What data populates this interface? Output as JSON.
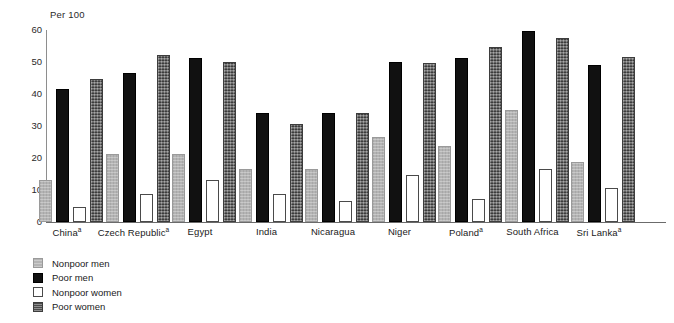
{
  "chart_data": {
    "type": "bar",
    "title": "",
    "subtitle": "",
    "xlabel": "",
    "ylabel": "Per 100",
    "ylim": [
      0,
      60
    ],
    "yticks": [
      0,
      10,
      20,
      30,
      40,
      50,
      60
    ],
    "grid": false,
    "legend_position": "bottom-left",
    "categories": [
      "China",
      "Czech Republic",
      "Egypt",
      "India",
      "Nicaragua",
      "Niger",
      "Poland",
      "South Africa",
      "Sri Lanka"
    ],
    "category_labels": [
      "Chinaᵃ",
      "Czech Republicᵃ",
      "Egypt",
      "India",
      "Nicaragua",
      "Niger",
      "Polandᵃ",
      "South Africa",
      "Sri Lankaᵃ"
    ],
    "category_footnote_marks": [
      "a",
      "a",
      "",
      "",
      "",
      "",
      "a",
      "",
      "a"
    ],
    "series": [
      {
        "name": "Nonpoor men",
        "color": "#b4b4b4",
        "values": [
          12.5,
          20.5,
          20.5,
          16.0,
          16.0,
          26.0,
          23.0,
          34.5,
          18.0
        ]
      },
      {
        "name": "Poor men",
        "color": "#111111",
        "values": [
          41.0,
          46.0,
          50.5,
          33.5,
          33.5,
          49.5,
          50.5,
          59.0,
          48.5
        ]
      },
      {
        "name": "Nonpoor women",
        "color": "#ffffff",
        "values": [
          4.0,
          8.0,
          12.5,
          8.0,
          6.0,
          14.0,
          6.5,
          16.0,
          10.0
        ]
      },
      {
        "name": "Poor women",
        "color": "#5d5d5d",
        "values": [
          44.0,
          51.5,
          49.5,
          30.0,
          33.5,
          49.0,
          54.0,
          57.0,
          51.0
        ]
      }
    ]
  },
  "legend": {
    "items": [
      {
        "label": "Nonpoor men",
        "swatch": "nonpoor-men"
      },
      {
        "label": "Poor men",
        "swatch": "poor-men"
      },
      {
        "label": "Nonpoor women",
        "swatch": "nonpoor-women"
      },
      {
        "label": "Poor women",
        "swatch": "poor-women"
      }
    ]
  },
  "axis": {
    "y_title": "Per 100"
  }
}
